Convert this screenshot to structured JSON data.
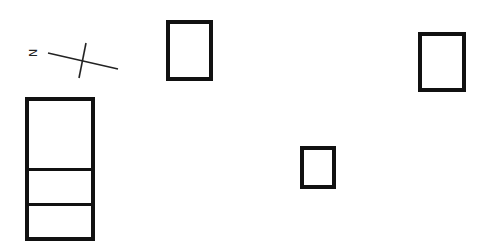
{
  "diagram": {
    "type": "site-plan",
    "north_arrow": {
      "label": "N"
    },
    "structures": [
      {
        "id": "building-left-tall",
        "sections": 3
      },
      {
        "id": "building-top-center",
        "sections": 1
      },
      {
        "id": "building-top-right",
        "sections": 1
      },
      {
        "id": "building-small-center",
        "sections": 1
      }
    ],
    "colors": {
      "line": "#111111",
      "background": "#ffffff"
    }
  }
}
